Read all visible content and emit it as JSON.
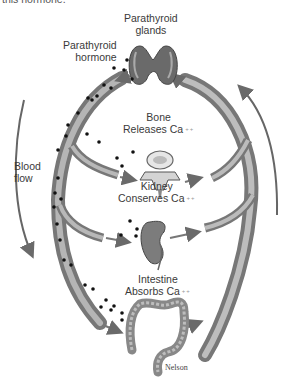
{
  "header": {
    "cut_text": "this hormone."
  },
  "labels": {
    "parathyroid_glands": [
      "Parathyroid",
      "glands"
    ],
    "parathyroid_hormone": [
      "Parathyroid",
      "hormone"
    ],
    "bone": [
      "Bone",
      "Releases Ca"
    ],
    "kidney": [
      "Kidney",
      "Conserves Ca"
    ],
    "intestine": [
      "Intestine",
      "Absorbs Ca"
    ],
    "blood_flow": [
      "Blood",
      "flow"
    ],
    "ion_charge": "++"
  },
  "signature": "Nelson",
  "colors": {
    "vessel": "#8e8e8e",
    "vessel_dark": "#6e6e6e",
    "vessel_light": "#c4c4c4",
    "dot": "#111111",
    "arrow": "#777777"
  }
}
